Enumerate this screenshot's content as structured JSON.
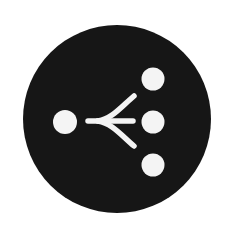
{
  "icon": {
    "name": "branch-split-icon",
    "label": "Split / branch into multiple outputs",
    "colors": {
      "background": "#ffffff",
      "disc": "#161616",
      "foreground": "#f4f4f4"
    },
    "disc": {
      "cx": 117,
      "cy": 119,
      "r": 94
    },
    "source_node": {
      "cx": 65,
      "cy": 122,
      "r": 12
    },
    "target_nodes": [
      {
        "cx": 153,
        "cy": 79,
        "r": 11.5
      },
      {
        "cx": 153,
        "cy": 122,
        "r": 11.5
      },
      {
        "cx": 153,
        "cy": 165,
        "r": 11.5
      }
    ],
    "stroke_width": 5.5
  }
}
